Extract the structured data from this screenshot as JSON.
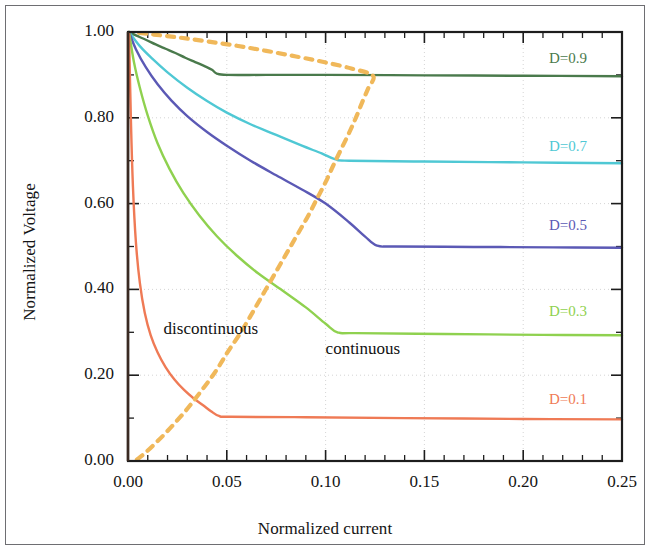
{
  "figure": {
    "background": "#ffffff",
    "frame_color": "#6e6e72"
  },
  "chart_data": {
    "type": "line",
    "title": "",
    "xlabel": "Normalized current",
    "ylabel": "Normalized Voltage",
    "xlim": [
      0.0,
      0.25
    ],
    "ylim": [
      0.0,
      1.0
    ],
    "xticks": [
      0.0,
      0.05,
      0.1,
      0.15,
      0.2,
      0.25
    ],
    "xtick_labels": [
      "0.00",
      "0.05",
      "0.10",
      "0.15",
      "0.20",
      "0.25"
    ],
    "yticks": [
      0.0,
      0.2,
      0.4,
      0.6,
      0.8,
      1.0
    ],
    "ytick_labels": [
      "0.00",
      "0.20",
      "0.40",
      "0.60",
      "0.80",
      "1.00"
    ],
    "x_minor_per_major": 5,
    "y_minor_per_major": 2,
    "grid": "dotted-major-both",
    "grid_color": "#c9c9c9",
    "legend_position": "inline-right-of-each-curve",
    "annotations": [
      {
        "text": "discontinuous",
        "x": 0.018,
        "y": 0.305,
        "color": "#111111"
      },
      {
        "text": "continuous",
        "x": 0.1,
        "y": 0.258,
        "color": "#111111"
      }
    ],
    "series": [
      {
        "name": "D=0.9",
        "label": "D=0.9",
        "color": "#4a7a4c",
        "label_x": 0.213,
        "label_y": 0.935,
        "ccm_value": 0.9,
        "knee_x": 0.045,
        "points": [
          [
            0.0005,
            1.0
          ],
          [
            0.004,
            0.992
          ],
          [
            0.009,
            0.982
          ],
          [
            0.014,
            0.971
          ],
          [
            0.019,
            0.961
          ],
          [
            0.024,
            0.951
          ],
          [
            0.029,
            0.94
          ],
          [
            0.034,
            0.93
          ],
          [
            0.039,
            0.92
          ],
          [
            0.0425,
            0.912
          ],
          [
            0.045,
            0.903
          ],
          [
            0.05,
            0.9
          ],
          [
            0.07,
            0.9
          ],
          [
            0.1,
            0.9
          ],
          [
            0.15,
            0.899
          ],
          [
            0.2,
            0.898
          ],
          [
            0.25,
            0.897
          ]
        ]
      },
      {
        "name": "D=0.7",
        "label": "D=0.7",
        "color": "#4fc8d4",
        "label_x": 0.213,
        "label_y": 0.73,
        "ccm_value": 0.7,
        "knee_x": 0.105,
        "points": [
          [
            0.0005,
            1.0
          ],
          [
            0.006,
            0.967
          ],
          [
            0.012,
            0.939
          ],
          [
            0.02,
            0.906
          ],
          [
            0.03,
            0.87
          ],
          [
            0.04,
            0.839
          ],
          [
            0.05,
            0.812
          ],
          [
            0.062,
            0.785
          ],
          [
            0.075,
            0.76
          ],
          [
            0.088,
            0.735
          ],
          [
            0.098,
            0.717
          ],
          [
            0.105,
            0.703
          ],
          [
            0.112,
            0.7
          ],
          [
            0.15,
            0.698
          ],
          [
            0.2,
            0.696
          ],
          [
            0.25,
            0.694
          ]
        ]
      },
      {
        "name": "D=0.5",
        "label": "D=0.5",
        "color": "#5b59b5",
        "label_x": 0.213,
        "label_y": 0.545,
        "ccm_value": 0.5,
        "knee_x": 0.125,
        "points": [
          [
            0.0005,
            1.0
          ],
          [
            0.004,
            0.96
          ],
          [
            0.009,
            0.918
          ],
          [
            0.015,
            0.878
          ],
          [
            0.022,
            0.84
          ],
          [
            0.03,
            0.804
          ],
          [
            0.04,
            0.767
          ],
          [
            0.05,
            0.735
          ],
          [
            0.062,
            0.7
          ],
          [
            0.075,
            0.666
          ],
          [
            0.088,
            0.633
          ],
          [
            0.1,
            0.6
          ],
          [
            0.112,
            0.556
          ],
          [
            0.12,
            0.523
          ],
          [
            0.126,
            0.502
          ],
          [
            0.135,
            0.5
          ],
          [
            0.175,
            0.499
          ],
          [
            0.215,
            0.498
          ],
          [
            0.25,
            0.497
          ]
        ]
      },
      {
        "name": "D=0.3",
        "label": "D=0.3",
        "color": "#8fd14f",
        "label_x": 0.213,
        "label_y": 0.345,
        "ccm_value": 0.3,
        "knee_x": 0.105,
        "points": [
          [
            0.0005,
            1.0
          ],
          [
            0.003,
            0.93
          ],
          [
            0.006,
            0.87
          ],
          [
            0.01,
            0.805
          ],
          [
            0.015,
            0.74
          ],
          [
            0.021,
            0.681
          ],
          [
            0.028,
            0.625
          ],
          [
            0.036,
            0.573
          ],
          [
            0.045,
            0.524
          ],
          [
            0.055,
            0.479
          ],
          [
            0.066,
            0.437
          ],
          [
            0.078,
            0.398
          ],
          [
            0.09,
            0.358
          ],
          [
            0.1,
            0.32
          ],
          [
            0.106,
            0.3
          ],
          [
            0.115,
            0.298
          ],
          [
            0.16,
            0.296
          ],
          [
            0.21,
            0.294
          ],
          [
            0.25,
            0.293
          ]
        ]
      },
      {
        "name": "D=0.1",
        "label": "D=0.1",
        "color": "#ef7a55",
        "label_x": 0.213,
        "label_y": 0.14,
        "ccm_value": 0.1,
        "knee_x": 0.046,
        "points": [
          [
            0.0005,
            1.0
          ],
          [
            0.0015,
            0.79
          ],
          [
            0.0025,
            0.64
          ],
          [
            0.004,
            0.51
          ],
          [
            0.006,
            0.415
          ],
          [
            0.0085,
            0.345
          ],
          [
            0.0115,
            0.293
          ],
          [
            0.015,
            0.253
          ],
          [
            0.019,
            0.219
          ],
          [
            0.0235,
            0.19
          ],
          [
            0.0285,
            0.165
          ],
          [
            0.033,
            0.147
          ],
          [
            0.038,
            0.13
          ],
          [
            0.042,
            0.116
          ],
          [
            0.046,
            0.105
          ],
          [
            0.052,
            0.103
          ],
          [
            0.09,
            0.102
          ],
          [
            0.14,
            0.1
          ],
          [
            0.2,
            0.098
          ],
          [
            0.25,
            0.097
          ]
        ]
      }
    ],
    "boundary": {
      "name": "ccm-dcm-boundary",
      "label": "",
      "color": "#f0b85a",
      "style": "dashed",
      "points": [
        [
          0.0045,
          0.003
        ],
        [
          0.009,
          0.02
        ],
        [
          0.014,
          0.042
        ],
        [
          0.019,
          0.065
        ],
        [
          0.024,
          0.09
        ],
        [
          0.029,
          0.116
        ],
        [
          0.0335,
          0.142
        ],
        [
          0.0385,
          0.172
        ],
        [
          0.043,
          0.2
        ],
        [
          0.047,
          0.228
        ],
        [
          0.051,
          0.258
        ],
        [
          0.056,
          0.292
        ],
        [
          0.061,
          0.33
        ],
        [
          0.066,
          0.37
        ],
        [
          0.071,
          0.41
        ],
        [
          0.076,
          0.45
        ],
        [
          0.081,
          0.49
        ],
        [
          0.086,
          0.53
        ],
        [
          0.091,
          0.57
        ],
        [
          0.0955,
          0.61
        ],
        [
          0.1,
          0.65
        ],
        [
          0.104,
          0.69
        ],
        [
          0.108,
          0.728
        ],
        [
          0.112,
          0.766
        ],
        [
          0.1155,
          0.802
        ],
        [
          0.1185,
          0.836
        ],
        [
          0.1215,
          0.868
        ],
        [
          0.124,
          0.898
        ],
        [
          0.113,
          0.915
        ],
        [
          0.099,
          0.93
        ],
        [
          0.085,
          0.943
        ],
        [
          0.07,
          0.956
        ],
        [
          0.055,
          0.968
        ],
        [
          0.04,
          0.978
        ],
        [
          0.026,
          0.987
        ],
        [
          0.013,
          0.994
        ],
        [
          0.003,
          0.999
        ]
      ]
    }
  }
}
